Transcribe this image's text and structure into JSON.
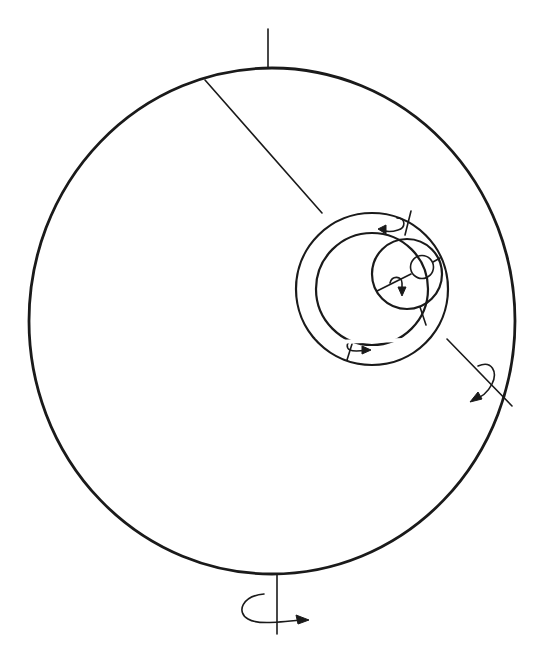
{
  "diagram": {
    "line_color": "#1a1a1a",
    "background": "#ffffff",
    "outer_sphere": {
      "cx": 272,
      "cy": 320,
      "rx": 243,
      "ry": 253
    },
    "vertical_axis": {
      "top": [
        272,
        30,
        272,
        68
      ],
      "bottom": [
        272,
        573,
        272,
        613
      ]
    },
    "bottom_rotation_arrow": {
      "label": ""
    },
    "ring_outer": {
      "cx": 372,
      "cy": 289,
      "r": 77
    },
    "ring_middle": {
      "cx": 372,
      "cy": 289,
      "r": 56
    },
    "inner_disc": {
      "cx": 407,
      "cy": 275,
      "r": 35
    },
    "small_circle": {
      "cx": 422,
      "cy": 267,
      "r": 12
    },
    "diagonal_axis": {
      "from": [
        205,
        80
      ],
      "to": [
        512,
        407
      ]
    },
    "text_labels": []
  }
}
